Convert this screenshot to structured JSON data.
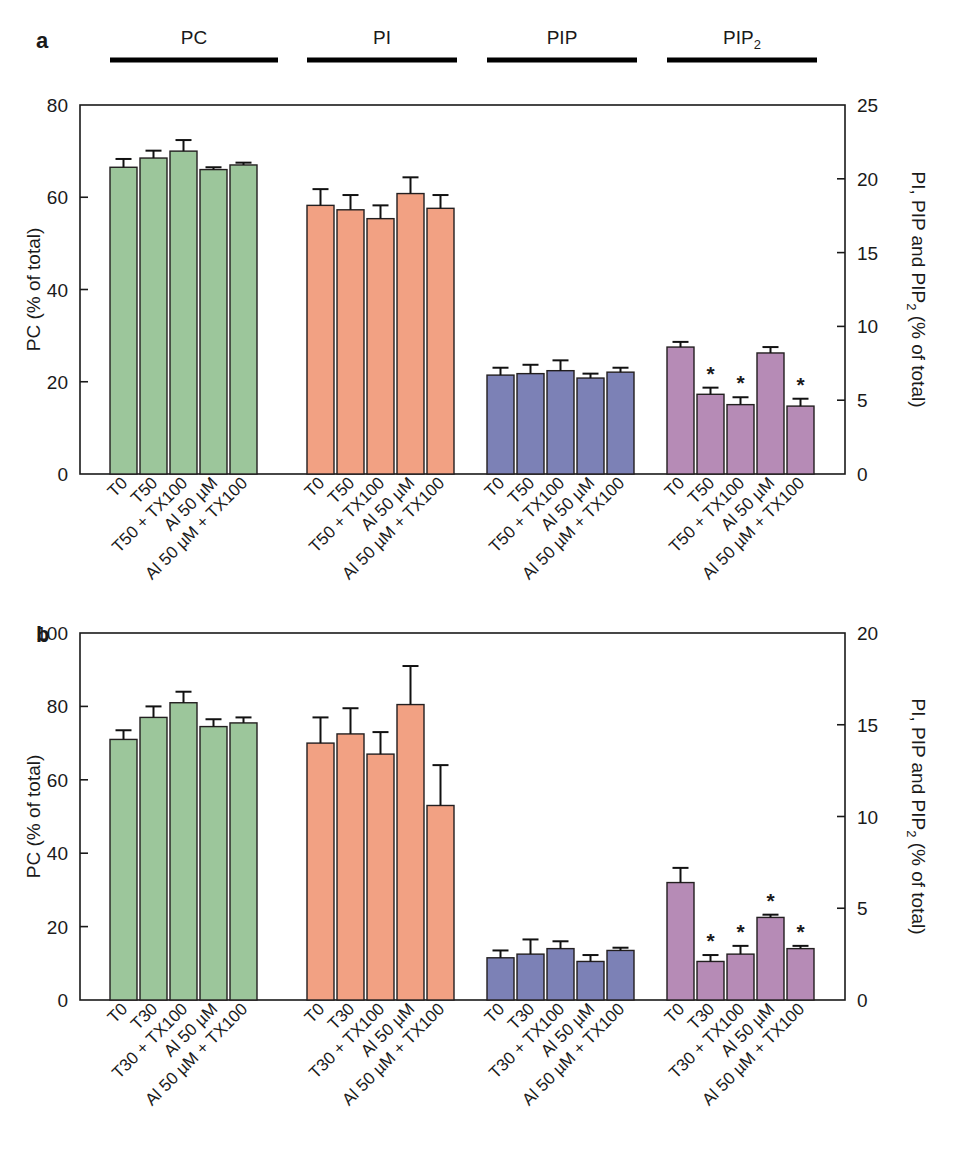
{
  "figure": {
    "panels": [
      {
        "letter": "a",
        "left_axis": {
          "title": "PC (% of total)",
          "ticks": [
            "0",
            "20",
            "40",
            "60",
            "80"
          ],
          "min": 0,
          "max": 80
        },
        "right_axis": {
          "title_parts": [
            "PI, PIP and PIP",
            "2",
            " (% of total)"
          ],
          "title": "PI, PIP and PIP2 (% of total)",
          "ticks": [
            "0",
            "5",
            "10",
            "15",
            "20",
            "25"
          ],
          "min": 0,
          "max": 25
        },
        "group_labels": [
          {
            "text": "PC",
            "sub": ""
          },
          {
            "text": "PI",
            "sub": ""
          },
          {
            "text": "PIP",
            "sub": ""
          },
          {
            "text": "PIP",
            "sub": "2"
          }
        ],
        "categories": [
          "T0",
          "T50",
          "T50 + TX100",
          "Al 50 µM",
          "Al 50 µM + TX100"
        ]
      },
      {
        "letter": "b",
        "left_axis": {
          "title": "PC (% of total)",
          "ticks": [
            "0",
            "20",
            "40",
            "60",
            "80",
            "100"
          ],
          "min": 0,
          "max": 100
        },
        "right_axis": {
          "title_parts": [
            "PI, PIP and PIP",
            "2",
            " (% of total)"
          ],
          "title": "PI, PIP and PIP2 (% of total)",
          "ticks": [
            "0",
            "5",
            "10",
            "15",
            "20"
          ],
          "min": 0,
          "max": 20
        },
        "group_labels": [
          {
            "text": "PC",
            "sub": ""
          },
          {
            "text": "PI",
            "sub": ""
          },
          {
            "text": "PIP",
            "sub": ""
          },
          {
            "text": "PIP",
            "sub": "2"
          }
        ],
        "categories": [
          "T0",
          "T30",
          "T30 + TX100",
          "Al 50 µM",
          "Al 50 µM + TX100"
        ]
      }
    ]
  },
  "colors": {
    "pc_green": "#9CC69B",
    "pi_orange": "#F2A183",
    "pip_blue": "#7C81B6",
    "pip2_mauve": "#B68BB6",
    "outline": "#231f20",
    "axis": "#1a1a1a"
  },
  "chart_data": [
    {
      "type": "bar",
      "title": "a",
      "xlabel": "",
      "ylabel": "PC (% of total)",
      "y2label": "PI, PIP and PIP2 (% of total)",
      "ylim": [
        0,
        80
      ],
      "y2lim": [
        0,
        25
      ],
      "grid": false,
      "legend": "none",
      "categories": [
        "T0",
        "T50",
        "T50 + TX100",
        "Al 50 µM",
        "Al 50 µM + TX100"
      ],
      "groups": [
        {
          "name": "PC",
          "axis": "left",
          "color": "#9CC69B",
          "values": [
            66.5,
            68.5,
            70.0,
            66.0,
            67.0
          ],
          "errors": [
            1.8,
            1.6,
            2.4,
            0.5,
            0.5
          ],
          "significance": [
            "",
            "",
            "",
            "",
            ""
          ]
        },
        {
          "name": "PI",
          "axis": "right",
          "color": "#F2A183",
          "values": [
            18.2,
            17.9,
            17.3,
            19.0,
            18.0
          ],
          "errors": [
            1.1,
            1.0,
            0.9,
            1.1,
            0.9
          ],
          "significance": [
            "",
            "",
            "",
            "",
            ""
          ]
        },
        {
          "name": "PIP",
          "axis": "right",
          "color": "#7C81B6",
          "values": [
            6.7,
            6.8,
            7.0,
            6.5,
            6.9
          ],
          "errors": [
            0.5,
            0.6,
            0.7,
            0.3,
            0.3
          ],
          "significance": [
            "",
            "",
            "",
            "",
            ""
          ]
        },
        {
          "name": "PIP2",
          "axis": "right",
          "color": "#B68BB6",
          "values": [
            8.6,
            5.4,
            4.7,
            8.2,
            4.6
          ],
          "errors": [
            0.35,
            0.45,
            0.5,
            0.4,
            0.5
          ],
          "significance": [
            "",
            "*",
            "*",
            "",
            "*"
          ]
        }
      ]
    },
    {
      "type": "bar",
      "title": "b",
      "xlabel": "",
      "ylabel": "PC (% of total)",
      "y2label": "PI, PIP and PIP2 (% of total)",
      "ylim": [
        0,
        100
      ],
      "y2lim": [
        0,
        20
      ],
      "grid": false,
      "legend": "none",
      "categories": [
        "T0",
        "T30",
        "T30 + TX100",
        "Al 50 µM",
        "Al 50 µM + TX100"
      ],
      "groups": [
        {
          "name": "PC",
          "axis": "left",
          "color": "#9CC69B",
          "values": [
            71.0,
            77.0,
            81.0,
            74.5,
            75.5
          ],
          "errors": [
            2.5,
            3.0,
            3.0,
            2.0,
            1.5
          ],
          "significance": [
            "",
            "",
            "",
            "",
            ""
          ]
        },
        {
          "name": "PI",
          "axis": "right",
          "color": "#F2A183",
          "values": [
            14.0,
            14.5,
            13.4,
            16.1,
            10.6
          ],
          "errors": [
            1.4,
            1.4,
            1.2,
            2.1,
            2.2
          ],
          "significance": [
            "",
            "",
            "",
            "",
            ""
          ]
        },
        {
          "name": "PIP",
          "axis": "right",
          "color": "#7C81B6",
          "values": [
            2.3,
            2.5,
            2.8,
            2.1,
            2.7
          ],
          "errors": [
            0.4,
            0.8,
            0.4,
            0.35,
            0.15
          ],
          "significance": [
            "",
            "",
            "",
            "",
            ""
          ]
        },
        {
          "name": "PIP2",
          "axis": "right",
          "color": "#B68BB6",
          "values": [
            6.4,
            2.1,
            2.5,
            4.5,
            2.8
          ],
          "errors": [
            0.8,
            0.35,
            0.45,
            0.15,
            0.15
          ],
          "significance": [
            "",
            "*",
            "*",
            "*",
            "*"
          ]
        }
      ]
    }
  ]
}
